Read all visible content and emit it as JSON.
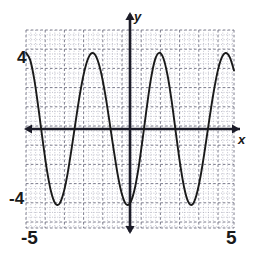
{
  "figure": {
    "kind": "coordinate-plane-graph",
    "background_color": "#ffffff",
    "axis_color": "#1c1c28",
    "curve_color": "#1a1a1a",
    "grid_color": "#8f8f9e",
    "axis_labels": {
      "y": "y",
      "x": "x"
    },
    "tick_labels": {
      "y_max": "4",
      "y_min": "-4",
      "x_min": "-5",
      "x_max": "5"
    }
  },
  "chart_data": {
    "type": "line",
    "title": "",
    "subtitle": "",
    "xlabel": "x",
    "ylabel": "y",
    "xlim": [
      -5,
      5
    ],
    "ylim": [
      -5.2,
      5.2
    ],
    "grid": true,
    "minor_grid": true,
    "legend": false,
    "legend_position": "none",
    "xticks": [
      -5,
      -4,
      -3,
      -2,
      -1,
      0,
      1,
      2,
      3,
      4,
      5
    ],
    "yticks": [
      -4,
      4
    ],
    "xtick_labels": [
      "-5",
      "",
      "",
      "",
      "",
      "",
      "",
      "",
      "",
      "",
      "5"
    ],
    "ytick_labels": [
      "-4",
      "4"
    ],
    "amplitude": 4,
    "period": 4.1,
    "function": "y = 4*cos(2*pi*(x + 5)/4.1)",
    "annotations": [],
    "series": [
      {
        "name": "curve",
        "color": "#1a1a1a",
        "x": [
          -5.0,
          -4.8,
          -4.6,
          -4.4,
          -4.2,
          -4.0,
          -3.8,
          -3.6,
          -3.4,
          -3.2,
          -3.0,
          -2.8,
          -2.6,
          -2.4,
          -2.2,
          -2.0,
          -1.8,
          -1.6,
          -1.4,
          -1.2,
          -1.0,
          -0.8,
          -0.6,
          -0.4,
          -0.2,
          0.0,
          0.2,
          0.4,
          0.6,
          0.8,
          1.0,
          1.2,
          1.4,
          1.6,
          1.8,
          2.0,
          2.2,
          2.4,
          2.6,
          2.8,
          3.0,
          3.2,
          3.4,
          3.6,
          3.8,
          4.0,
          4.2,
          4.4,
          4.6,
          4.8,
          5.0
        ],
        "y": [
          4.0,
          3.63,
          2.59,
          1.08,
          -0.58,
          -2.12,
          -3.27,
          -3.9,
          -3.94,
          -3.38,
          -2.34,
          -0.98,
          0.49,
          1.88,
          3.01,
          3.74,
          3.99,
          3.74,
          3.01,
          1.88,
          0.49,
          -0.98,
          -2.34,
          -3.38,
          -3.94,
          -3.9,
          -3.27,
          -2.12,
          -0.58,
          1.08,
          2.59,
          3.63,
          4.0,
          3.73,
          2.85,
          1.49,
          -0.16,
          -1.77,
          -3.06,
          -3.83,
          -3.97,
          -3.45,
          -2.43,
          -1.08,
          0.4,
          1.8,
          2.96,
          3.72,
          3.99,
          3.76,
          3.07
        ]
      }
    ]
  }
}
